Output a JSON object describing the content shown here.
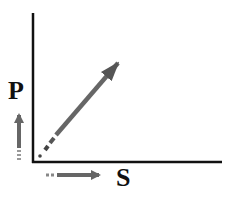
{
  "diagram": {
    "axes": {
      "y_axis_label": "P",
      "x_axis_label": "S"
    },
    "arrows": [
      {
        "name": "vertical-increase-arrow",
        "direction": "up",
        "meaning": "P increases"
      },
      {
        "name": "horizontal-increase-arrow",
        "direction": "right",
        "meaning": "S increases"
      },
      {
        "name": "diagonal-trend-arrow",
        "direction": "up-right",
        "meaning": "P increases with S"
      }
    ],
    "colors": {
      "axis": "#111111",
      "arrow": "#666666",
      "background": "#ffffff"
    }
  }
}
